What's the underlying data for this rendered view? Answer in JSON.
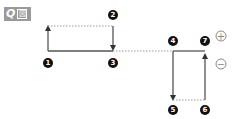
{
  "header": {
    "badge_q": "Q",
    "badge_zu": "図"
  },
  "markers": [
    {
      "id": "1",
      "label": "1"
    },
    {
      "id": "2",
      "label": "2"
    },
    {
      "id": "3",
      "label": "3"
    },
    {
      "id": "4",
      "label": "4"
    },
    {
      "id": "5",
      "label": "5"
    },
    {
      "id": "6",
      "label": "6"
    },
    {
      "id": "7",
      "label": "7"
    }
  ],
  "signs": {
    "plus": "+",
    "minus": "−"
  },
  "colors": {
    "line": "#555555",
    "dotted": "#9a9a9a",
    "marker_bg": "#111111",
    "badge_bg": "#9a9a9a"
  }
}
